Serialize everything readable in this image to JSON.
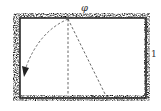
{
  "diagram": {
    "labels": {
      "top": "φ",
      "right": "1"
    },
    "colors": {
      "border": "#2a2a2a",
      "stipple": "#8a8a8a",
      "dash": "#555555",
      "background": "#ffffff"
    }
  }
}
